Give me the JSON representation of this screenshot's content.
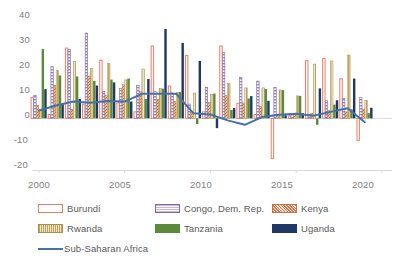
{
  "chart_data": {
    "type": "bar",
    "title": "",
    "subtitle": "",
    "xlabel": "",
    "ylabel": "",
    "x": [
      2000,
      2001,
      2002,
      2003,
      2004,
      2005,
      2006,
      2007,
      2008,
      2009,
      2010,
      2011,
      2012,
      2013,
      2014,
      2015,
      2016,
      2017,
      2018,
      2019
    ],
    "xticks": [
      "2000",
      "2005",
      "2010",
      "2015",
      "2020"
    ],
    "yticks": [
      "40",
      "30",
      "20",
      "10",
      "0",
      "-10",
      "-20"
    ],
    "ylim": [
      -20,
      40
    ],
    "xlim": [
      1999.4,
      2020.6
    ],
    "grid": false,
    "legend_position": "bottom",
    "series": [
      {
        "name": "Burundi",
        "kind": "bar",
        "color": "#ED7D64",
        "fill": "none",
        "values": [
          8.0,
          1.5,
          27.2,
          5.5,
          22.5,
          6.0,
          2.5,
          28.0,
          12.5,
          24.3,
          2.5,
          28.0,
          5.8,
          1.5,
          -15.5,
          1.0,
          22.3,
          23.2,
          15.3,
          -8.5
        ]
      },
      {
        "name": "Congo, Dem. Rep.",
        "kind": "bar",
        "color": "#9A86B8",
        "fill": "hstripe",
        "values": [
          8.8,
          20.0,
          26.6,
          33.0,
          10.4,
          11.5,
          12.8,
          10.3,
          9.8,
          5.5,
          11.9,
          25.4,
          15.8,
          14.4,
          12.0,
          1.5,
          1.5,
          6.8,
          7.7,
          8.0
        ]
      },
      {
        "name": "Kenya",
        "kind": "bar",
        "color": "#D99C7C",
        "fill": "hatch",
        "values": [
          5.0,
          12.8,
          3.5,
          16.4,
          9.0,
          13.0,
          10.4,
          7.4,
          6.6,
          2.5,
          6.1,
          8.8,
          6.0,
          4.5,
          1.0,
          1.5,
          2.0,
          3.0,
          2.5,
          3.5
        ]
      },
      {
        "name": "Rwanda",
        "kind": "bar",
        "color": "#BFA15A",
        "fill": "dots",
        "values": [
          3.0,
          18.5,
          22.0,
          19.3,
          21.2,
          14.9,
          19.1,
          11.6,
          10.0,
          9.8,
          9.2,
          13.5,
          11.8,
          11.8,
          11.0,
          8.7,
          21.0,
          22.2,
          24.5,
          7.0
        ]
      },
      {
        "name": "Tanzania",
        "kind": "bar",
        "color": "#5B8A3C",
        "fill": "solid",
        "values": [
          26.8,
          16.6,
          16.2,
          14.5,
          15.0,
          15.4,
          7.5,
          11.5,
          10.2,
          -2.2,
          9.6,
          3.2,
          7.7,
          11.4,
          10.9,
          8.7,
          -2.5,
          5.3,
          3.5,
          2.0
        ]
      },
      {
        "name": "Uganda",
        "kind": "bar",
        "color": "#1F3864",
        "fill": "solid",
        "values": [
          11.3,
          5.5,
          7.5,
          12.7,
          13.9,
          6.5,
          15.2,
          34.6,
          29.2,
          22.2,
          -3.8,
          4.0,
          8.6,
          6.8,
          1.2,
          2.0,
          11.6,
          7.0,
          15.4,
          4.1
        ]
      },
      {
        "name": "Sub-Saharan Africa",
        "kind": "line",
        "color": "#4472A8",
        "values": [
          3.0,
          5.0,
          6.5,
          6.0,
          6.7,
          6.5,
          9.5,
          9.5,
          9.5,
          2.0,
          1.5,
          -0.8,
          -2.5,
          0.5,
          1.4,
          1.8,
          1.0,
          2.5,
          3.9,
          -1.5
        ]
      }
    ]
  },
  "legend": {
    "items": [
      {
        "label": "Burundi"
      },
      {
        "label": "Congo, Dem. Rep."
      },
      {
        "label": "Kenya"
      },
      {
        "label": "Rwanda"
      },
      {
        "label": "Tanzania"
      },
      {
        "label": "Uganda"
      },
      {
        "label": "Sub-Saharan Africa"
      }
    ]
  }
}
